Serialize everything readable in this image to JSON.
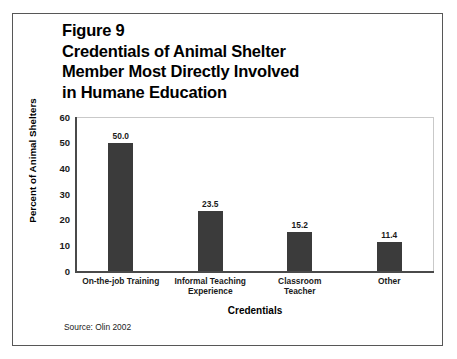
{
  "figure": {
    "title": "Figure 9\nCredentials of Animal Shelter\nMember Most Directly Involved\nin Humane Education",
    "source_note": "Source: Olin 2002"
  },
  "chart_data": {
    "type": "bar",
    "title": "Figure 9 Credentials of Animal Shelter Member Most Directly Involved in Humane Education",
    "categories": [
      "On-the-job Training",
      "Informal Teaching\nExperience",
      "Classroom\nTeacher",
      "Other"
    ],
    "values": [
      50.0,
      23.5,
      15.2,
      11.4
    ],
    "value_labels": [
      "50.0",
      "23.5",
      "15.2",
      "11.4"
    ],
    "xlabel": "Credentials",
    "ylabel": "Percent of Animal Shelters",
    "ylim": [
      0,
      60
    ],
    "yticks": [
      "60",
      "50",
      "40",
      "30",
      "20",
      "10",
      "0"
    ],
    "ytick_values": [
      60,
      50,
      40,
      30,
      20,
      10,
      0
    ],
    "grid": "horizontal",
    "legend": null,
    "bar_color": "#3b3b3b",
    "grid_color": "#dcdcdc",
    "axis_color": "#4a4a4a",
    "background": "#ffffff"
  }
}
